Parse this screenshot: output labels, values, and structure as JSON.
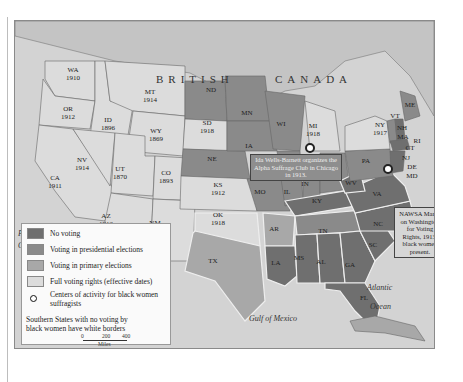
{
  "map": {
    "region_labels": {
      "british": "BRITISH",
      "canada": "CANADA"
    },
    "oceans": {
      "pacific_1": "Pacific",
      "pacific_2": "Ocean",
      "atlantic_1": "Atlantic",
      "atlantic_2": "Ocean",
      "gulf": "Gulf of Mexico"
    },
    "states": [
      {
        "abbr": "WA",
        "year": "1910",
        "category": "full"
      },
      {
        "abbr": "OR",
        "year": "1912",
        "category": "full"
      },
      {
        "abbr": "CA",
        "year": "1911",
        "category": "full"
      },
      {
        "abbr": "ID",
        "year": "1896",
        "category": "full"
      },
      {
        "abbr": "NV",
        "year": "1914",
        "category": "full"
      },
      {
        "abbr": "MT",
        "year": "1914",
        "category": "full"
      },
      {
        "abbr": "WY",
        "year": "1869",
        "category": "full"
      },
      {
        "abbr": "UT",
        "year": "1870",
        "category": "full"
      },
      {
        "abbr": "CO",
        "year": "1893",
        "category": "full"
      },
      {
        "abbr": "AZ",
        "year": "1912",
        "category": "full"
      },
      {
        "abbr": "NM",
        "year": "",
        "category": "full"
      },
      {
        "abbr": "ND",
        "year": "",
        "category": "presidential"
      },
      {
        "abbr": "SD",
        "year": "1918",
        "category": "full"
      },
      {
        "abbr": "NE",
        "year": "",
        "category": "presidential"
      },
      {
        "abbr": "KS",
        "year": "1912",
        "category": "full"
      },
      {
        "abbr": "OK",
        "year": "1918",
        "category": "full"
      },
      {
        "abbr": "TX",
        "year": "",
        "category": "primary"
      },
      {
        "abbr": "MN",
        "year": "",
        "category": "presidential"
      },
      {
        "abbr": "IA",
        "year": "",
        "category": "presidential"
      },
      {
        "abbr": "MO",
        "year": "",
        "category": "presidential"
      },
      {
        "abbr": "AR",
        "year": "",
        "category": "primary"
      },
      {
        "abbr": "LA",
        "year": "",
        "category": "none"
      },
      {
        "abbr": "WI",
        "year": "",
        "category": "presidential"
      },
      {
        "abbr": "IL",
        "year": "",
        "category": "presidential"
      },
      {
        "abbr": "MI",
        "year": "1918",
        "category": "full"
      },
      {
        "abbr": "IN",
        "year": "",
        "category": "presidential"
      },
      {
        "abbr": "OH",
        "year": "",
        "category": "presidential"
      },
      {
        "abbr": "KY",
        "year": "",
        "category": "none"
      },
      {
        "abbr": "TN",
        "year": "",
        "category": "presidential"
      },
      {
        "abbr": "MS",
        "year": "",
        "category": "none"
      },
      {
        "abbr": "AL",
        "year": "",
        "category": "none"
      },
      {
        "abbr": "GA",
        "year": "",
        "category": "none"
      },
      {
        "abbr": "FL",
        "year": "",
        "category": "none"
      },
      {
        "abbr": "SC",
        "year": "",
        "category": "none"
      },
      {
        "abbr": "NC",
        "year": "",
        "category": "none"
      },
      {
        "abbr": "VA",
        "year": "",
        "category": "none"
      },
      {
        "abbr": "WV",
        "year": "",
        "category": "none"
      },
      {
        "abbr": "PA",
        "year": "",
        "category": "presidential"
      },
      {
        "abbr": "NY",
        "year": "1917",
        "category": "full"
      },
      {
        "abbr": "VT",
        "year": "",
        "category": "presidential"
      },
      {
        "abbr": "NH",
        "year": "",
        "category": "none"
      },
      {
        "abbr": "ME",
        "year": "",
        "category": "presidential"
      },
      {
        "abbr": "MA",
        "year": "",
        "category": "none"
      },
      {
        "abbr": "RI",
        "year": "",
        "category": "presidential"
      },
      {
        "abbr": "CT",
        "year": "",
        "category": "none"
      },
      {
        "abbr": "NJ",
        "year": "",
        "category": "none"
      },
      {
        "abbr": "DE",
        "year": "",
        "category": "none"
      },
      {
        "abbr": "MD",
        "year": "",
        "category": "none"
      }
    ],
    "callouts": {
      "chicago": "Ida Wells-Barnett organizes the Alpha Suffrage Club in Chicago in 1913.",
      "washington": "NAWSA March on Washington for Voting Rights, 1913, black women present."
    }
  },
  "legend": {
    "items": [
      {
        "label": "No voting",
        "color": "#6f6f6f"
      },
      {
        "label": "Voting in presidential elections",
        "color": "#8a8a8a"
      },
      {
        "label": "Voting in primary elections",
        "color": "#a8a8a8"
      },
      {
        "label": "Full voting rights (effective dates)",
        "color": "#dcdcdc"
      }
    ],
    "centers_label": "Centers of activity for black women suffragists",
    "note": "Southern States with no voting by black women have white borders",
    "scale": {
      "ticks": [
        "0",
        "200",
        "400"
      ],
      "unit": "Miles"
    }
  },
  "colors": {
    "none": "#6f6f6f",
    "presidential": "#8a8a8a",
    "primary": "#a8a8a8",
    "full": "#dcdcdc",
    "water": "#d0d0d0",
    "canada": "#c8c8c8"
  }
}
